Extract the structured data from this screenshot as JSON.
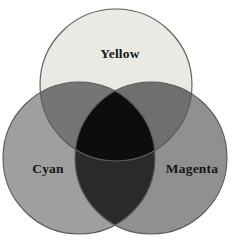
{
  "diagram": {
    "type": "venn",
    "labels": {
      "top_circle": "Yellow",
      "bottom_left_circle": "Cyan",
      "bottom_right_circle": "Magenta"
    },
    "colors": {
      "background": "#ffffff",
      "yellow_fill": "#eae9e3",
      "cyan_fill": "#9f9f9f",
      "magenta_fill": "#909090",
      "yellow_cyan_overlap": "#757575",
      "yellow_magenta_overlap": "#6f6f6f",
      "cyan_magenta_overlap": "#2a2a2a",
      "triple_overlap": "#0d0d0d",
      "outline": "#5a5a5a",
      "label_text": "#161616"
    }
  }
}
